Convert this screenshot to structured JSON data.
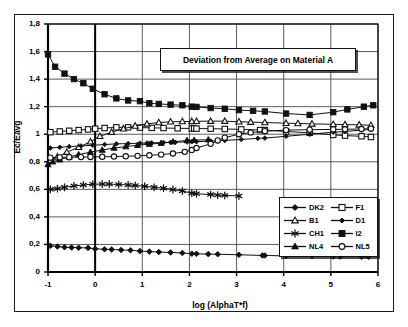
{
  "chart_data": {
    "type": "line",
    "title": "Deviation from Average on Material A",
    "xlabel": "log (AlphaT*f)",
    "ylabel": "Ec/Eavg",
    "xlim": [
      -1,
      6
    ],
    "ylim": [
      0,
      1.8
    ],
    "xticks": [
      "-1",
      "0",
      "1",
      "2",
      "3",
      "4",
      "5",
      "6"
    ],
    "xtick_values": [
      -1,
      0,
      1,
      2,
      3,
      4,
      5,
      6
    ],
    "yticks": [
      "0",
      "0,2",
      "0,4",
      "0,6",
      "0,8",
      "1",
      "1,2",
      "1,4",
      "1,6",
      "1,8"
    ],
    "ytick_values": [
      0,
      0.2,
      0.4,
      0.6,
      0.8,
      1.0,
      1.2,
      1.4,
      1.6,
      1.8
    ],
    "grid": true,
    "legend_position": "inside-lower-right",
    "series": [
      {
        "name": "DK2",
        "marker": "filled-diamond",
        "x": [
          -0.95,
          -0.8,
          -0.65,
          -0.5,
          -0.35,
          -0.15,
          0.0,
          0.2,
          0.35,
          0.55,
          0.75,
          0.95,
          1.15,
          1.35,
          1.6,
          1.85,
          2.05,
          2.15,
          2.4,
          2.6,
          3.05,
          3.55,
          3.6,
          4.05,
          4.6,
          5.05,
          5.2,
          5.65,
          5.8
        ],
        "y": [
          0.19,
          0.185,
          0.18,
          0.178,
          0.176,
          0.175,
          0.168,
          0.165,
          0.163,
          0.16,
          0.158,
          0.152,
          0.148,
          0.145,
          0.142,
          0.138,
          0.133,
          0.132,
          0.13,
          0.129,
          0.125,
          0.12,
          0.12,
          0.117,
          0.115,
          0.113,
          0.112,
          0.111,
          0.11
        ]
      },
      {
        "name": "F1",
        "marker": "open-square",
        "x": [
          -0.95,
          -0.75,
          -0.55,
          -0.35,
          -0.15,
          0.0,
          0.2,
          0.45,
          0.7,
          0.95,
          1.2,
          1.45,
          1.75,
          2.05,
          2.1,
          2.15,
          2.45,
          2.75,
          3.1,
          3.5,
          3.6,
          4.05,
          4.55,
          5.05,
          5.3,
          5.65,
          5.85
        ],
        "y": [
          1.015,
          1.02,
          1.025,
          1.03,
          1.035,
          1.04,
          1.045,
          1.05,
          1.05,
          1.048,
          1.046,
          1.045,
          1.043,
          1.042,
          1.042,
          1.041,
          1.04,
          1.038,
          1.035,
          1.03,
          1.03,
          1.02,
          1.01,
          0.995,
          0.99,
          0.985,
          0.98
        ]
      },
      {
        "name": "B1",
        "marker": "open-triangle",
        "x": [
          -0.95,
          -0.8,
          -0.6,
          -0.35,
          -0.1,
          0.1,
          0.35,
          0.6,
          0.85,
          1.1,
          1.35,
          1.6,
          1.85,
          2.05,
          2.15,
          2.45,
          2.75,
          3.05,
          3.3,
          3.6,
          4.05,
          4.3,
          4.6,
          5.05,
          5.3,
          5.6,
          5.85
        ],
        "y": [
          0.81,
          0.835,
          0.87,
          0.905,
          0.945,
          0.985,
          1.015,
          1.04,
          1.06,
          1.075,
          1.085,
          1.09,
          1.092,
          1.093,
          1.094,
          1.095,
          1.095,
          1.09,
          1.088,
          1.085,
          1.08,
          1.078,
          1.075,
          1.072,
          1.07,
          1.068,
          1.065
        ]
      },
      {
        "name": "D1",
        "marker": "small-filled-diamond",
        "x": [
          -0.95,
          -0.75,
          -0.55,
          -0.3,
          -0.05,
          0.2,
          0.45,
          0.7,
          0.95,
          1.1,
          1.2,
          1.45,
          1.6,
          1.7,
          1.95,
          2.05,
          2.15,
          2.45,
          2.75,
          3.1,
          3.45,
          3.6,
          4.05,
          4.55,
          5.05,
          5.3,
          5.65,
          5.85
        ],
        "y": [
          0.9,
          0.905,
          0.91,
          0.915,
          0.92,
          0.925,
          0.93,
          0.932,
          0.935,
          0.936,
          0.937,
          0.94,
          0.941,
          0.942,
          0.944,
          0.945,
          0.946,
          0.95,
          0.955,
          0.962,
          0.97,
          0.972,
          0.985,
          1.0,
          1.015,
          1.02,
          1.03,
          1.035
        ]
      },
      {
        "name": "CH1",
        "marker": "asterisk",
        "x": [
          -0.95,
          -0.8,
          -0.65,
          -0.45,
          -0.25,
          -0.05,
          0.15,
          0.3,
          0.5,
          0.7,
          0.85,
          1.05,
          1.25,
          1.45,
          1.65,
          1.85,
          2.05,
          2.15,
          2.45,
          2.6,
          2.75,
          3.05
        ],
        "y": [
          0.6,
          0.605,
          0.615,
          0.625,
          0.632,
          0.637,
          0.638,
          0.638,
          0.635,
          0.632,
          0.628,
          0.622,
          0.615,
          0.608,
          0.598,
          0.588,
          0.572,
          0.568,
          0.562,
          0.558,
          0.556,
          0.552
        ]
      },
      {
        "name": "I2",
        "marker": "filled-square",
        "x": [
          -1.0,
          -0.85,
          -0.65,
          -0.45,
          -0.25,
          -0.05,
          0.2,
          0.45,
          0.7,
          0.95,
          1.15,
          1.35,
          1.6,
          1.85,
          2.05,
          2.15,
          2.45,
          2.75,
          3.05,
          3.35,
          3.6,
          4.05,
          4.55,
          5.05,
          5.35,
          5.7,
          5.9
        ],
        "y": [
          1.58,
          1.49,
          1.44,
          1.4,
          1.37,
          1.33,
          1.29,
          1.26,
          1.245,
          1.24,
          1.225,
          1.22,
          1.215,
          1.21,
          1.2,
          1.198,
          1.19,
          1.185,
          1.175,
          1.17,
          1.165,
          1.15,
          1.14,
          1.16,
          1.18,
          1.2,
          1.21
        ]
      },
      {
        "name": "NL4",
        "marker": "filled-triangle",
        "x": [
          -1.0,
          -0.9,
          -0.75,
          -0.55,
          -0.35,
          -0.1,
          0.15,
          0.4,
          0.65,
          0.9,
          1.15,
          1.4,
          1.65,
          1.95,
          2.1,
          2.4
        ],
        "y": [
          0.78,
          0.8,
          0.815,
          0.835,
          0.852,
          0.87,
          0.885,
          0.9,
          0.91,
          0.92,
          0.928,
          0.935,
          0.945,
          0.955,
          0.957,
          0.96
        ]
      },
      {
        "name": "NL5",
        "marker": "open-circle",
        "x": [
          -0.95,
          -0.75,
          -0.55,
          -0.3,
          -0.1,
          0.15,
          0.4,
          0.65,
          0.9,
          1.15,
          1.4,
          1.65,
          1.9,
          2.05,
          2.15,
          2.45,
          2.6,
          2.75,
          3.05,
          3.3,
          3.6,
          4.05,
          4.55,
          5.05,
          5.3,
          5.65,
          5.85
        ],
        "y": [
          0.83,
          0.832,
          0.833,
          0.834,
          0.835,
          0.836,
          0.838,
          0.84,
          0.843,
          0.847,
          0.852,
          0.86,
          0.872,
          0.885,
          0.9,
          0.93,
          0.955,
          0.975,
          1.0,
          1.012,
          1.022,
          1.03,
          1.033,
          1.035,
          1.036,
          1.038,
          1.04
        ]
      }
    ],
    "legend_entries": [
      {
        "name": "DK2",
        "marker": "filled-diamond"
      },
      {
        "name": "F1",
        "marker": "open-square"
      },
      {
        "name": "B1",
        "marker": "open-triangle"
      },
      {
        "name": "D1",
        "marker": "small-filled-diamond"
      },
      {
        "name": "CH1",
        "marker": "asterisk"
      },
      {
        "name": "I2",
        "marker": "filled-square"
      },
      {
        "name": "NL4",
        "marker": "filled-triangle"
      },
      {
        "name": "NL5",
        "marker": "open-circle"
      }
    ],
    "colors": {
      "line": "#111111",
      "grid": "#4a4a4a",
      "axis": "#000000",
      "background": "#ffffff"
    }
  }
}
